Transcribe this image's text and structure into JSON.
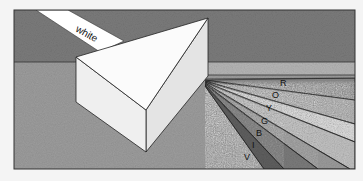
{
  "figure": {
    "incoming_label": "white",
    "spectrum": [
      {
        "key": "R",
        "label": "R",
        "color": "#8a8a8a"
      },
      {
        "key": "O",
        "label": "O",
        "color": "#a8a8a8"
      },
      {
        "key": "Y",
        "label": "Y",
        "color": "#dcdcdc"
      },
      {
        "key": "G",
        "label": "G",
        "color": "#bdbdbd"
      },
      {
        "key": "B",
        "label": "B",
        "color": "#9a9a9a"
      },
      {
        "key": "I",
        "label": "I",
        "color": "#7a7a7a"
      },
      {
        "key": "V",
        "label": "V",
        "color": "#5e5e5e"
      }
    ]
  },
  "colors": {
    "background": "#f4f4f4",
    "wall": "#7b7b7b",
    "floor": "#9c9c9c",
    "band": "#b4b4b4",
    "prism_top": "#fbfbfb",
    "prism_front": "#eeeeee",
    "prism_side": "#e2e2e2",
    "beam": "#ffffff",
    "outline": "#222222"
  }
}
